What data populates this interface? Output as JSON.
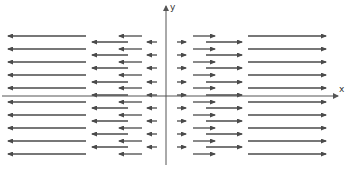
{
  "diagram": {
    "type": "vector-field",
    "axes": {
      "x_label": "x",
      "y_label": "y",
      "origin_px": [
        166,
        96
      ],
      "x_axis": {
        "x1": 2,
        "x2": 338,
        "y": 96
      },
      "y_axis": {
        "x": 166,
        "y1": 165,
        "y2": 6
      }
    },
    "colors": {
      "arrow": "#4a4a4a",
      "axis": "#555555",
      "background": "#ffffff"
    },
    "row_sets": {
      "even_rows_y": [
        36,
        49,
        62,
        75,
        88,
        102,
        115,
        128,
        141,
        154
      ],
      "odd_rows_y": [
        42,
        55,
        68,
        82,
        95,
        108,
        121,
        134,
        147
      ]
    },
    "arrow_columns": {
      "even": [
        {
          "x_tail": 86,
          "x_head": 8
        },
        {
          "x_tail": 142,
          "x_head": 119
        },
        {
          "x_tail": 193,
          "x_head": 215
        },
        {
          "x_tail": 248,
          "x_head": 326
        }
      ],
      "odd": [
        {
          "x_tail": 128,
          "x_head": 92
        },
        {
          "x_tail": 157,
          "x_head": 147
        },
        {
          "x_tail": 177,
          "x_head": 186
        },
        {
          "x_tail": 206,
          "x_head": 242
        }
      ]
    }
  }
}
